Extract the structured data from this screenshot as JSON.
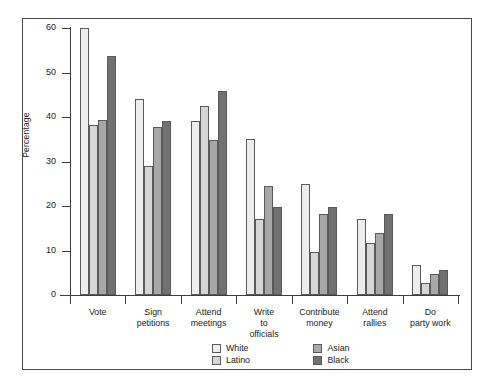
{
  "chart_data": {
    "type": "bar",
    "title": "",
    "subtitle": "",
    "xlabel": "",
    "ylabel": "Percentage",
    "ylim": [
      0,
      60
    ],
    "yticks": [
      0,
      10,
      20,
      30,
      40,
      50,
      60
    ],
    "ytick_labels": [
      "0",
      "10",
      "20",
      "30",
      "40",
      "50",
      "60"
    ],
    "grid": false,
    "legend_position": "bottom",
    "categories": [
      "Vote",
      "Sign petitions",
      "Attend meetings",
      "Write to officials",
      "Contribute money",
      "Attend rallies",
      "Do party work"
    ],
    "category_lines": [
      [
        "Vote"
      ],
      [
        "Sign",
        "petitions"
      ],
      [
        "Attend",
        "meetings"
      ],
      [
        "Write",
        "to",
        "officials"
      ],
      [
        "Contribute",
        "money"
      ],
      [
        "Attend",
        "rallies"
      ],
      [
        "Do",
        "party work"
      ]
    ],
    "series": [
      {
        "name": "White",
        "color": "#ededed",
        "values": [
          60.0,
          44.0,
          39.0,
          35.0,
          25.0,
          17.0,
          6.7
        ]
      },
      {
        "name": "Latino",
        "color": "#d6d6d6",
        "values": [
          38.2,
          29.0,
          42.5,
          17.0,
          9.7,
          11.8,
          2.7
        ]
      },
      {
        "name": "Asian",
        "color": "#a8a8a8",
        "values": [
          39.3,
          37.8,
          34.8,
          24.5,
          18.2,
          14.0,
          4.7
        ]
      },
      {
        "name": "Black",
        "color": "#717171",
        "values": [
          53.7,
          39.2,
          45.8,
          19.8,
          19.8,
          18.2,
          5.6
        ]
      }
    ]
  },
  "legend": {
    "entries": [
      {
        "label": "White"
      },
      {
        "label": "Latino"
      },
      {
        "label": "Asian"
      },
      {
        "label": "Black"
      }
    ]
  }
}
